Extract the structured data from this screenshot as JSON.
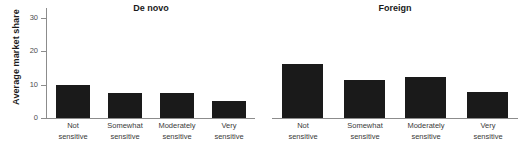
{
  "chart_data": {
    "type": "bar",
    "title": "",
    "xlabel": "",
    "ylabel": "Average market share",
    "ylim": [
      0,
      33
    ],
    "yticks": [
      0,
      10,
      20,
      30
    ],
    "ytick_labels": [
      "0",
      "10",
      "20",
      "30"
    ],
    "grid": false,
    "legend": "none",
    "categories": [
      "Not sensitive",
      "Somewhat sensitive",
      "Moderately sensitive",
      "Very sensitive"
    ],
    "category_lines": [
      [
        "Not",
        "sensitive"
      ],
      [
        "Somewhat",
        "sensitive"
      ],
      [
        "Moderately",
        "sensitive"
      ],
      [
        "Very",
        "sensitive"
      ]
    ],
    "panels": [
      {
        "title": "De novo",
        "values": [
          10.0,
          7.5,
          7.5,
          5.2
        ]
      },
      {
        "title": "Foreign",
        "values": [
          16.2,
          11.3,
          12.3,
          7.8
        ]
      }
    ],
    "bar_color": "#1a1a1a",
    "axis_color": "#8c8c8c"
  }
}
